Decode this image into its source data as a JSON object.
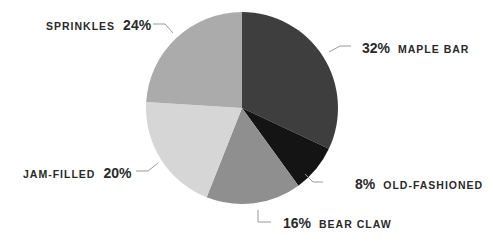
{
  "chart_data": {
    "type": "pie",
    "title": "",
    "start_angle_deg": 0,
    "direction": "clockwise",
    "slices": [
      {
        "label": "MAPLE BAR",
        "value": 32,
        "display": "32%",
        "color": "#3e3e3e"
      },
      {
        "label": "OLD-FASHIONED",
        "value": 8,
        "display": "8%",
        "color": "#141414"
      },
      {
        "label": "BEAR CLAW",
        "value": 16,
        "display": "16%",
        "color": "#8f8f8f"
      },
      {
        "label": "JAM-FILLED",
        "value": 20,
        "display": "20%",
        "color": "#d6d6d6"
      },
      {
        "label": "SPRINKLES",
        "value": 24,
        "display": "24%",
        "color": "#ababab"
      }
    ],
    "legend": "none (direct labels with leader lines)"
  },
  "labels": {
    "maple_bar": {
      "pct": "32%",
      "name": "MAPLE BAR"
    },
    "old_fashioned": {
      "pct": "8%",
      "name": "OLD-FASHIONED"
    },
    "bear_claw": {
      "pct": "16%",
      "name": "BEAR CLAW"
    },
    "jam_filled": {
      "pct": "20%",
      "name": "JAM-FILLED"
    },
    "sprinkles": {
      "pct": "24%",
      "name": "SPRINKLES"
    }
  }
}
